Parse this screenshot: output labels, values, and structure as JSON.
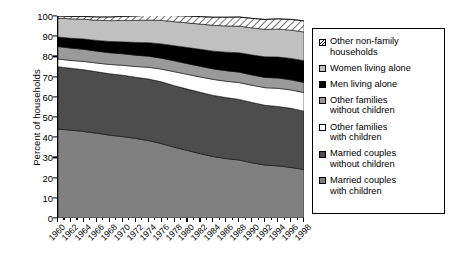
{
  "chart_data": {
    "type": "area",
    "title": "",
    "xlabel": "",
    "ylabel": "Percent of households",
    "ylim": [
      0,
      100
    ],
    "ytick_values": [
      0,
      10,
      20,
      30,
      40,
      50,
      60,
      70,
      80,
      90,
      100
    ],
    "ytick_labels": [
      "0",
      "10",
      "20",
      "30",
      "40",
      "50",
      "60",
      "70",
      "80",
      "90",
      "100"
    ],
    "xlim": [
      1960,
      1998
    ],
    "x": [
      1960,
      1962,
      1964,
      1966,
      1968,
      1970,
      1972,
      1974,
      1976,
      1978,
      1980,
      1982,
      1984,
      1986,
      1988,
      1990,
      1992,
      1994,
      1996,
      1998
    ],
    "xtick_labels": [
      "1960",
      "1962",
      "1964",
      "1966",
      "1968",
      "1970",
      "1972",
      "1974",
      "1976",
      "1978",
      "1980",
      "1982",
      "1984",
      "1986",
      "1988",
      "1990",
      "1992",
      "1994",
      "1996",
      "1998"
    ],
    "grid": false,
    "legend_position": "right",
    "stacked": true,
    "stack_order": "bottom-to-top",
    "series": [
      {
        "name": "Married couples with children",
        "fill": "#808080",
        "pattern": "solid",
        "values": [
          44.0,
          43.5,
          42.8,
          42.0,
          41.0,
          40.3,
          39.4,
          38.3,
          36.8,
          35.0,
          33.4,
          31.8,
          30.4,
          29.4,
          28.7,
          27.3,
          26.2,
          25.8,
          25.0,
          24.0
        ]
      },
      {
        "name": "Married couples without children",
        "fill": "#4d4d4d",
        "pattern": "solid",
        "values": [
          30.9,
          30.6,
          30.6,
          30.4,
          30.4,
          30.4,
          30.3,
          30.5,
          30.6,
          30.5,
          30.4,
          30.4,
          30.3,
          30.2,
          30.0,
          29.9,
          29.6,
          29.4,
          29.3,
          28.9
        ]
      },
      {
        "name": "Other families with children",
        "fill": "#ffffff",
        "pattern": "solid",
        "values": [
          3.8,
          3.9,
          4.1,
          4.3,
          4.6,
          4.9,
          5.3,
          5.8,
          6.3,
          6.9,
          7.3,
          7.6,
          7.9,
          8.1,
          8.3,
          8.5,
          8.7,
          9.0,
          9.1,
          9.2
        ]
      },
      {
        "name": "Other families without children",
        "fill": "#9a9a9a",
        "pattern": "solid",
        "values": [
          6.2,
          6.1,
          6.0,
          5.9,
          5.8,
          5.7,
          5.6,
          5.5,
          5.4,
          5.4,
          5.3,
          5.3,
          5.2,
          5.2,
          5.2,
          5.1,
          5.1,
          5.1,
          5.0,
          5.0
        ]
      },
      {
        "name": "Men living alone",
        "fill": "#000000",
        "pattern": "solid",
        "values": [
          4.7,
          4.9,
          5.1,
          5.3,
          5.6,
          5.9,
          6.3,
          6.7,
          7.1,
          7.5,
          8.0,
          8.4,
          8.8,
          9.2,
          9.6,
          9.9,
          10.2,
          10.4,
          10.6,
          10.8
        ]
      },
      {
        "name": "Women living alone",
        "fill": "#c0c0c0",
        "pattern": "solid",
        "values": [
          9.4,
          9.6,
          9.8,
          10.0,
          10.3,
          10.6,
          10.9,
          11.2,
          11.6,
          11.9,
          12.2,
          12.5,
          12.8,
          13.0,
          13.2,
          13.4,
          13.6,
          13.8,
          14.0,
          14.2
        ]
      },
      {
        "name": "Other  non-family households",
        "fill": "#ffffff",
        "pattern": "hatch-diagonal",
        "values": [
          1.0,
          1.2,
          1.4,
          1.6,
          1.8,
          2.0,
          2.2,
          2.4,
          2.7,
          3.0,
          3.4,
          3.7,
          4.0,
          4.3,
          4.5,
          4.7,
          4.9,
          5.1,
          5.3,
          5.5
        ]
      }
    ]
  },
  "legend": {
    "items": [
      {
        "label": "Other  non-family\nhouseholds",
        "swatch": "hatch",
        "color": "#ffffff"
      },
      {
        "label": "Women living alone",
        "swatch": "lightgray",
        "color": "#c0c0c0"
      },
      {
        "label": "Men living alone",
        "swatch": "black",
        "color": "#000000"
      },
      {
        "label": "Other families\nwithout children",
        "swatch": "medgray",
        "color": "#9a9a9a"
      },
      {
        "label": "Other families\nwith children",
        "swatch": "white",
        "color": "#ffffff"
      },
      {
        "label": "Married couples\nwithout children",
        "swatch": "darkgray",
        "color": "#4d4d4d"
      },
      {
        "label": "Married couples\nwith children",
        "swatch": "midgray2",
        "color": "#808080"
      }
    ]
  }
}
